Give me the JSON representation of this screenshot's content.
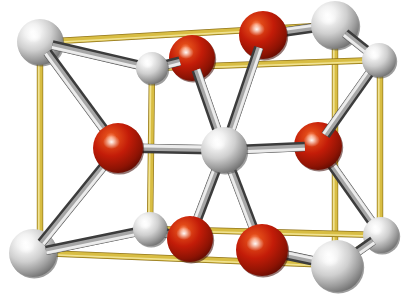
{
  "figure": {
    "kind": "crystal-structure-unit-cell",
    "structure_name": "rutile",
    "background_color": "#ffffff",
    "width": 406,
    "height": 306,
    "caption": ""
  },
  "palette": {
    "cell_edge": "#D9C04A",
    "cell_edge_dark": "#B9951F",
    "cell_edge_light": "#EFE08C",
    "metal_atom": "#D8D8D8",
    "metal_atom_shadow": "#707070",
    "metal_atom_highlight": "#FFFFFF",
    "oxygen_atom": "#C01808",
    "oxygen_atom_shadow": "#5E0A03",
    "oxygen_atom_highlight": "#FFF0E0",
    "bond_light": "#C9C9C9",
    "bond_dark": "#4A4A4A",
    "bond_mid": "#9A9A9A"
  },
  "legend": {
    "metal_label": "metal atom (large / small light sphere)",
    "oxygen_label": "oxygen atom (red sphere)",
    "edge_label": "unit cell edge"
  },
  "cell_box": {
    "note": "tetragonal box drawn in oblique projection",
    "vertices": {
      "back_top_left": [
        40,
        42
      ],
      "back_top_right": [
        335,
        25
      ],
      "back_bottom_left": [
        40,
        253
      ],
      "back_bottom_right": [
        335,
        265
      ],
      "front_top_left": [
        152,
        68
      ],
      "front_top_right": [
        380,
        60
      ],
      "front_bottom_left": [
        150,
        229
      ],
      "front_bottom_right": [
        380,
        235
      ]
    },
    "edges": [
      [
        "back_top_left",
        "back_top_right"
      ],
      [
        "back_top_left",
        "back_bottom_left"
      ],
      [
        "back_bottom_left",
        "back_bottom_right"
      ],
      [
        "back_top_right",
        "back_bottom_right"
      ],
      [
        "front_top_left",
        "front_top_right"
      ],
      [
        "front_top_left",
        "front_bottom_left"
      ],
      [
        "front_bottom_left",
        "front_bottom_right"
      ],
      [
        "front_top_right",
        "front_bottom_right"
      ],
      [
        "back_top_left",
        "front_top_left"
      ],
      [
        "back_top_right",
        "front_top_right"
      ],
      [
        "back_bottom_left",
        "front_bottom_left"
      ],
      [
        "back_bottom_right",
        "front_bottom_right"
      ]
    ]
  },
  "atoms": [
    {
      "id": "M1",
      "element": "metal",
      "x": 40,
      "y": 42,
      "r": 23,
      "depth": "back",
      "label": "corner-metal-back-top-left"
    },
    {
      "id": "M2",
      "element": "metal",
      "x": 335,
      "y": 25,
      "r": 24,
      "depth": "back",
      "label": "corner-metal-back-top-right"
    },
    {
      "id": "M3",
      "element": "metal",
      "x": 33,
      "y": 253,
      "r": 24,
      "depth": "back",
      "label": "corner-metal-back-bottom-left"
    },
    {
      "id": "M4",
      "element": "metal",
      "x": 337,
      "y": 266,
      "r": 26,
      "depth": "front",
      "label": "corner-metal-front-bottom-right"
    },
    {
      "id": "M5",
      "element": "metal",
      "x": 152,
      "y": 68,
      "r": 16,
      "depth": "front",
      "label": "corner-metal-front-top-left"
    },
    {
      "id": "M6",
      "element": "metal",
      "x": 379,
      "y": 60,
      "r": 17,
      "depth": "front",
      "label": "corner-metal-front-top-right"
    },
    {
      "id": "M7",
      "element": "metal",
      "x": 150,
      "y": 229,
      "r": 17,
      "depth": "front",
      "label": "corner-metal-front-bottom-left"
    },
    {
      "id": "M8",
      "element": "metal",
      "x": 381,
      "y": 235,
      "r": 18,
      "depth": "back",
      "label": "corner-metal-back-bottom-right"
    },
    {
      "id": "MC",
      "element": "metal",
      "x": 224,
      "y": 150,
      "r": 23,
      "depth": "center",
      "label": "body-center-metal"
    },
    {
      "id": "O1",
      "element": "oxygen",
      "x": 192,
      "y": 58,
      "r": 23,
      "depth": "back",
      "label": "oxygen-upper-left"
    },
    {
      "id": "O2",
      "element": "oxygen",
      "x": 263,
      "y": 35,
      "r": 24,
      "depth": "back",
      "label": "oxygen-upper-right"
    },
    {
      "id": "O3",
      "element": "oxygen",
      "x": 118,
      "y": 148,
      "r": 25,
      "depth": "front",
      "label": "oxygen-mid-left"
    },
    {
      "id": "O4",
      "element": "oxygen",
      "x": 318,
      "y": 146,
      "r": 24,
      "depth": "back",
      "label": "oxygen-mid-right"
    },
    {
      "id": "O5",
      "element": "oxygen",
      "x": 190,
      "y": 239,
      "r": 23,
      "depth": "front",
      "label": "oxygen-lower-left"
    },
    {
      "id": "O6",
      "element": "oxygen",
      "x": 262,
      "y": 250,
      "r": 26,
      "depth": "front",
      "label": "oxygen-lower-right"
    }
  ],
  "bonds": [
    {
      "from": "MC",
      "to": "O1",
      "style": "metal-oxygen",
      "label": "bond-center-to-upper-left-oxygen"
    },
    {
      "from": "MC",
      "to": "O2",
      "style": "metal-oxygen",
      "label": "bond-center-to-upper-right-oxygen"
    },
    {
      "from": "MC",
      "to": "O3",
      "style": "metal-oxygen",
      "label": "bond-center-to-mid-left-oxygen"
    },
    {
      "from": "MC",
      "to": "O4",
      "style": "metal-oxygen",
      "label": "bond-center-to-mid-right-oxygen"
    },
    {
      "from": "MC",
      "to": "O5",
      "style": "metal-oxygen",
      "label": "bond-center-to-lower-left-oxygen"
    },
    {
      "from": "MC",
      "to": "O6",
      "style": "metal-oxygen",
      "label": "bond-center-to-lower-right-oxygen"
    },
    {
      "from": "M1",
      "to": "O3",
      "style": "metal-oxygen",
      "label": "bond-back-top-left-metal-to-mid-left-oxygen"
    },
    {
      "from": "M1",
      "to": "M5",
      "style": "metal-oxygen",
      "label": "bond-back-top-left-metal-to-front-top-left-metal"
    },
    {
      "from": "M5",
      "to": "O1",
      "style": "metal-oxygen",
      "label": "bond-front-top-left-metal-to-upper-left-oxygen"
    },
    {
      "from": "M2",
      "to": "O2",
      "style": "metal-oxygen",
      "label": "bond-back-top-right-metal-to-upper-right-oxygen"
    },
    {
      "from": "M2",
      "to": "M6",
      "style": "metal-oxygen",
      "label": "bond-back-top-right-metal-to-front-top-right-metal"
    },
    {
      "from": "M6",
      "to": "O4",
      "style": "metal-oxygen",
      "label": "bond-front-top-right-metal-to-mid-right-oxygen"
    },
    {
      "from": "M3",
      "to": "O3",
      "style": "metal-oxygen",
      "label": "bond-back-bottom-left-metal-to-mid-left-oxygen"
    },
    {
      "from": "M3",
      "to": "M7",
      "style": "metal-oxygen",
      "label": "bond-back-bottom-left-metal-to-front-bottom-left-metal"
    },
    {
      "from": "M7",
      "to": "O5",
      "style": "metal-oxygen",
      "label": "bond-front-bottom-left-metal-to-lower-left-oxygen"
    },
    {
      "from": "M4",
      "to": "O6",
      "style": "metal-oxygen",
      "label": "bond-front-bottom-right-metal-to-lower-right-oxygen"
    },
    {
      "from": "M4",
      "to": "M8",
      "style": "metal-oxygen",
      "label": "bond-front-bottom-right-metal-to-back-bottom-right-metal"
    },
    {
      "from": "M8",
      "to": "O4",
      "style": "metal-oxygen",
      "label": "bond-back-bottom-right-metal-to-mid-right-oxygen"
    }
  ]
}
